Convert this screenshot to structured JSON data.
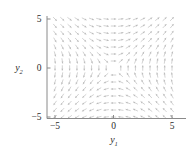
{
  "figure": {
    "kind": "direction-field",
    "background": "#ffffff",
    "arrow_color": "#b9b9b9",
    "axis_color": "#8a8a8a",
    "text_color": "#2b2b2b"
  },
  "axes": {
    "x": {
      "title": "y",
      "subscript": "1",
      "ticks": [
        "-5",
        "0",
        "5"
      ],
      "tick_values": [
        -5,
        0,
        5
      ],
      "range": [
        -5.6,
        5.6
      ]
    },
    "y": {
      "title": "y",
      "subscript": "2",
      "ticks": [
        "5",
        "0",
        "-5"
      ],
      "tick_values": [
        5,
        0,
        -5
      ],
      "range": [
        -5.6,
        5.6
      ]
    }
  },
  "chart_data": {
    "type": "scatter",
    "subtype": "quiver-direction-field",
    "title": "",
    "xlabel": "y1",
    "ylabel": "y2",
    "xlim": [
      -5.6,
      5.6
    ],
    "ylim": [
      -5.6,
      5.6
    ],
    "grid": false,
    "legend": null,
    "xticks": [
      -5,
      0,
      5
    ],
    "yticks": [
      -5,
      0,
      5
    ],
    "xticklabels": [
      "-5",
      "0",
      "5"
    ],
    "yticklabels": [
      "-5",
      "0",
      "5"
    ],
    "field": {
      "description": "Normalized direction field of a planar autonomous system with a saddle-type critical point at the origin. Arrows are unit-length and uniformly shaded light gray.",
      "grid_columns": 17,
      "grid_rows": 15,
      "x_start": -5.0,
      "x_step": 0.625,
      "y_start": -5.0,
      "y_step": 0.714,
      "vector_field": {
        "u_expression": "y2",
        "v_expression": "y1",
        "normalized": true,
        "arrow_length_px": 4.6,
        "head_length_px": 1.9
      },
      "critical_point": [
        0,
        0
      ],
      "critical_point_type": "saddle",
      "unstable_direction": [
        1,
        1
      ],
      "stable_direction": [
        1,
        -1
      ],
      "quadrant_flow": {
        "upper_left": "arrows point left and down-left",
        "upper_right": "arrows point up and up-right",
        "lower_left": "arrows point up-right and right",
        "lower_right": "arrows point right and down-right"
      }
    }
  }
}
